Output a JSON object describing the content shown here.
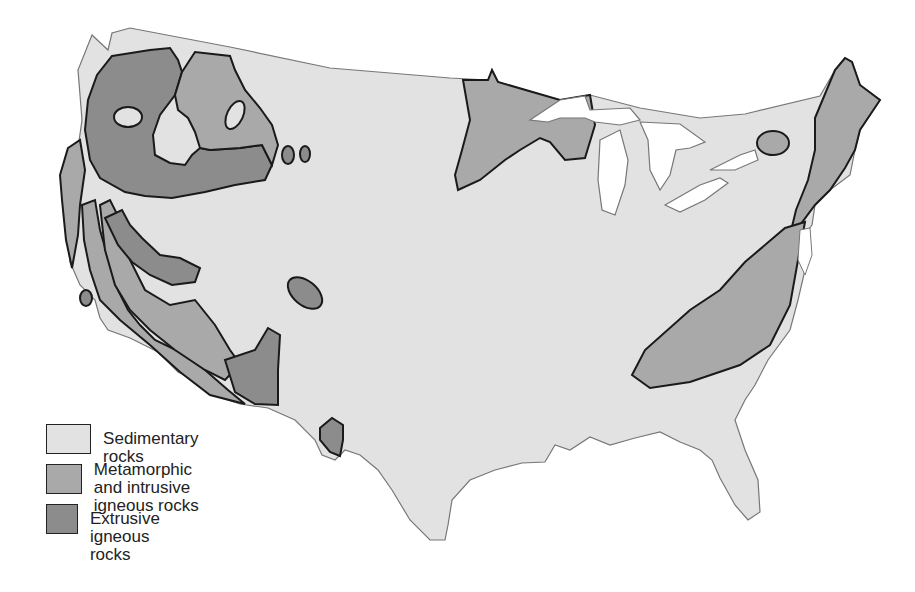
{
  "map": {
    "subject": "Bedrock types of the conterminous United States",
    "colors": {
      "sedimentary": "#e2e2e2",
      "metamorphic_intrusive": "#a9a9a9",
      "extrusive": "#8c8c8c",
      "water": "#ffffff",
      "outline": "#1a1a1a",
      "coast": "#777777"
    }
  },
  "legend": {
    "items": [
      {
        "key": "sedimentary",
        "label": "Sedimentary rocks"
      },
      {
        "key": "metamorphic_intrusive",
        "label": "Metamorphic and intrusive\nigneous rocks"
      },
      {
        "key": "extrusive",
        "label": "Extrusive igneous rocks"
      }
    ]
  }
}
